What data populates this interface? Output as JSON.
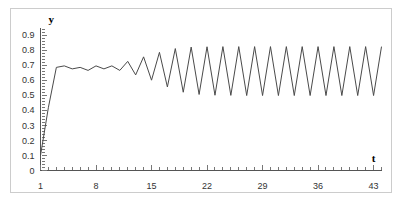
{
  "figure": {
    "background_color": "#ffffff",
    "frame_color": "#cccccc",
    "line_color": "#4a4a4a",
    "axis_color": "#555555"
  },
  "axes": {
    "y_label": "y",
    "x_label": "t"
  },
  "chart_data": {
    "type": "line",
    "title": "",
    "subtitle": "",
    "xlabel": "t",
    "ylabel": "y",
    "xlim": [
      1,
      44
    ],
    "ylim": [
      0,
      0.95
    ],
    "grid": false,
    "legend": null,
    "x_tick_labels": [
      "1",
      "8",
      "15",
      "22",
      "29",
      "36",
      "43"
    ],
    "x_tick_values": [
      1,
      8,
      15,
      22,
      29,
      36,
      43
    ],
    "x_minor_tick_step": 1,
    "y_tick_labels": [
      "0",
      "0.1",
      "0.2",
      "0.3",
      "0.4",
      "0.5",
      "0.6",
      "0.7",
      "0.8",
      "0.9"
    ],
    "y_tick_values": [
      0,
      0.1,
      0.2,
      0.3,
      0.4,
      0.5,
      0.6,
      0.7,
      0.8,
      0.9
    ],
    "series": [
      {
        "name": "y(t)",
        "color": "#4a4a4a",
        "x": [
          1,
          2,
          3,
          4,
          5,
          6,
          7,
          8,
          9,
          10,
          11,
          12,
          13,
          14,
          15,
          16,
          17,
          18,
          19,
          20,
          21,
          22,
          23,
          24,
          25,
          26,
          27,
          28,
          29,
          30,
          31,
          32,
          33,
          34,
          35,
          36,
          37,
          38,
          39,
          40,
          41,
          42,
          43,
          44
        ],
        "values": [
          0.1,
          0.42,
          0.685,
          0.695,
          0.675,
          0.685,
          0.665,
          0.695,
          0.675,
          0.695,
          0.665,
          0.725,
          0.635,
          0.755,
          0.6,
          0.785,
          0.555,
          0.81,
          0.52,
          0.82,
          0.505,
          0.822,
          0.5,
          0.823,
          0.499,
          0.823,
          0.498,
          0.823,
          0.498,
          0.823,
          0.498,
          0.823,
          0.498,
          0.823,
          0.498,
          0.823,
          0.498,
          0.823,
          0.498,
          0.823,
          0.498,
          0.823,
          0.498,
          0.823
        ]
      }
    ]
  }
}
